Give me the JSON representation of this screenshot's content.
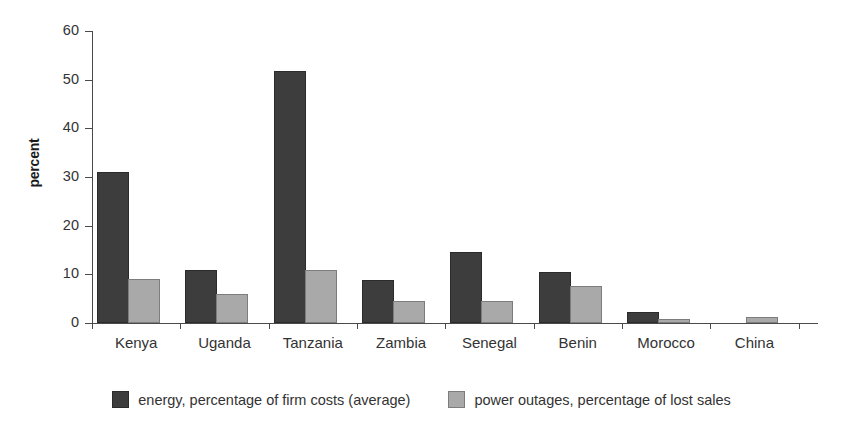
{
  "chart_data": {
    "type": "bar",
    "title": "",
    "xlabel": "",
    "ylabel": "percent",
    "ylim": [
      0,
      60
    ],
    "yticks": [
      0,
      10,
      20,
      30,
      40,
      50,
      60
    ],
    "grid": false,
    "legend_position": "bottom",
    "categories": [
      "Kenya",
      "Uganda",
      "Tanzania",
      "Zambia",
      "Senegal",
      "Benin",
      "Morocco",
      "China"
    ],
    "series": [
      {
        "name": "energy, percentage of firm costs (average)",
        "color": "#3d3d3d",
        "values": [
          30.7,
          10.5,
          51.4,
          8.4,
          14.1,
          10.1,
          1.9,
          0
        ]
      },
      {
        "name": "power outages, percentage of lost sales",
        "color": "#a9a9a9",
        "values": [
          8.7,
          5.5,
          10.4,
          4.2,
          4.1,
          7.1,
          0.4,
          0.9
        ]
      }
    ]
  },
  "axis": {
    "y_tick_labels": [
      "0",
      "10",
      "20",
      "30",
      "40",
      "50",
      "60"
    ],
    "y_axis_title": "percent"
  },
  "legend": {
    "items": [
      {
        "label": "energy, percentage of firm costs (average)",
        "swatch": "dark-swatch"
      },
      {
        "label": "power outages, percentage of lost sales",
        "swatch": "light-swatch"
      }
    ]
  }
}
